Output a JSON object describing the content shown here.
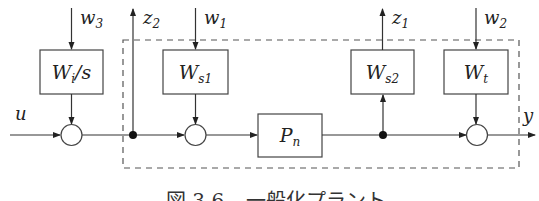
{
  "diagram": {
    "colors": {
      "line": "#333333",
      "dashed": "#555555",
      "background": "#ffffff"
    },
    "blocks": [
      {
        "id": "Wi_s",
        "label_main": "W",
        "label_sub": "i",
        "label_suffix": "/s",
        "x": 40,
        "y": 50,
        "w": 63,
        "h": 44
      },
      {
        "id": "Ws1",
        "label_main": "W",
        "label_sub": "s1",
        "label_suffix": "",
        "x": 163,
        "y": 50,
        "w": 65,
        "h": 44
      },
      {
        "id": "Ws2",
        "label_main": "W",
        "label_sub": "s2",
        "label_suffix": "",
        "x": 351,
        "y": 50,
        "w": 63,
        "h": 44
      },
      {
        "id": "Wt",
        "label_main": "W",
        "label_sub": "t",
        "label_suffix": "",
        "x": 444,
        "y": 50,
        "w": 64,
        "h": 44
      },
      {
        "id": "Pn",
        "label_main": "P",
        "label_sub": "n",
        "label_suffix": "",
        "x": 258,
        "y": 114,
        "w": 64,
        "h": 43
      }
    ],
    "summing_junctions": [
      {
        "id": "sum1",
        "cx": 71,
        "cy": 135,
        "r": 10
      },
      {
        "id": "sum2",
        "cx": 195,
        "cy": 135,
        "r": 10
      },
      {
        "id": "sum3",
        "cx": 477,
        "cy": 135,
        "r": 10
      }
    ],
    "branch_points": [
      {
        "id": "branch1",
        "cx": 133,
        "cy": 135
      },
      {
        "id": "branch2",
        "cx": 383,
        "cy": 135
      }
    ],
    "signals": {
      "w3": {
        "main": "w",
        "sub": "3"
      },
      "z2": {
        "main": "z",
        "sub": "2"
      },
      "w1": {
        "main": "w",
        "sub": "1"
      },
      "z1": {
        "main": "z",
        "sub": "1"
      },
      "w2": {
        "main": "w",
        "sub": "2"
      },
      "u": {
        "main": "u",
        "sub": ""
      },
      "y": {
        "main": "y",
        "sub": ""
      }
    },
    "generalized_plant_boundary": {
      "x": 123,
      "y": 40,
      "w": 396,
      "h": 128,
      "style": "dashed"
    },
    "caption": {
      "figure_label": "図 3.6",
      "text": "一般化プラント"
    }
  }
}
